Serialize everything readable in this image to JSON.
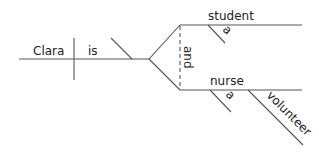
{
  "diagram": {
    "type": "sentence-diagram",
    "subject": "Clara",
    "verb": "is",
    "conjunction": "and",
    "complements": [
      {
        "word": "student",
        "modifiers": [
          "a"
        ]
      },
      {
        "word": "nurse",
        "modifiers": [
          "a",
          "volunteer"
        ]
      }
    ],
    "labels": {
      "subject": "Clara",
      "verb": "is",
      "conj": "and",
      "upper": "student",
      "upper_mod": "a",
      "lower": "nurse",
      "lower_mod1": "a",
      "lower_mod2": "volunteer"
    },
    "colors": {
      "line": "#555555",
      "text": "#222222",
      "background": "#ffffff"
    }
  }
}
